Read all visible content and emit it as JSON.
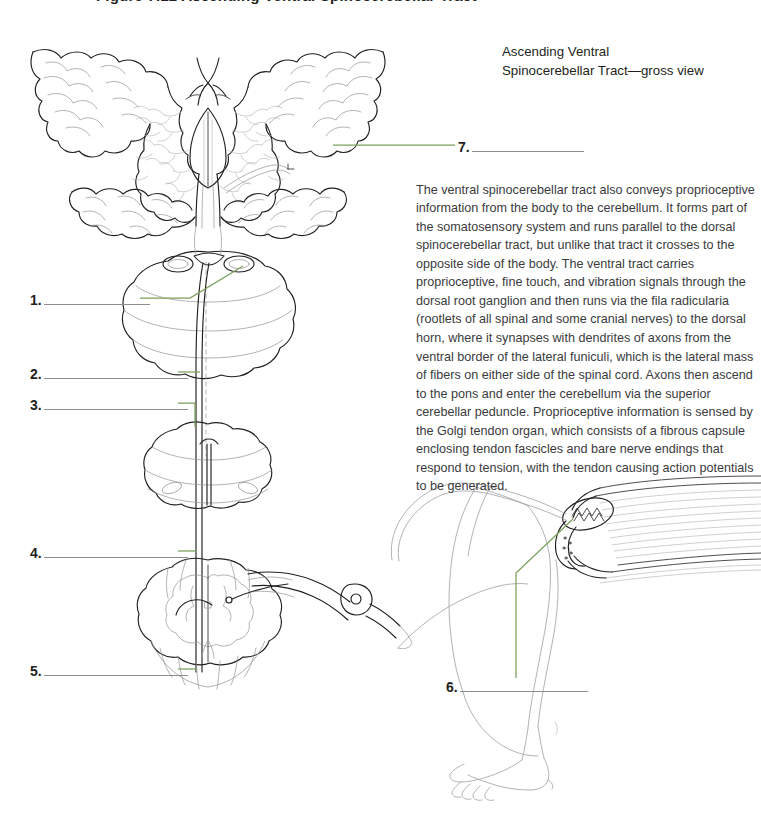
{
  "page": {
    "background": "#ffffff",
    "width": 761,
    "height": 814
  },
  "colors": {
    "ink": "#231f20",
    "body_text": "#3b3b3d",
    "leader_green": "#7ba05b",
    "blank_rule": "#8d8d90",
    "art_stroke_dark": "#231f20",
    "art_stroke_light": "#9a9a9e"
  },
  "cutoff_heading": {
    "text": "Figure 7.12 Ascending Ventral Spinocerebellar Tract"
  },
  "heading": {
    "line1": "Ascending Ventral",
    "line2": "Spinocerebellar Tract—gross view"
  },
  "body": {
    "paragraph": "The ventral spinocerebellar tract also conveys proprioceptive information from the body to the cerebellum. It forms part of the somatosensory system and runs parallel to the dorsal spinocerebellar tract, but unlike that tract it crosses to the opposite side of the body. The ventral tract carries proprioceptive, fine touch, and vibration signals through the dorsal root ganglion and then runs via the fila radicularia (rootlets of all spinal and some cranial nerves) to the dorsal horn, where it synapses with dendrites of axons from the ventral border of the lateral funiculi, which is the lateral mass of fibers on either side of the spinal cord. Axons then ascend to the pons and enter the cerebellum via the superior cerebellar peduncle. Proprioceptive information is sensed by the Golgi tendon organ, which consists of a fibrous capsule enclosing tendon fascicles and bare nerve endings that respond to tension, with the tendon causing action potentials to be generated."
  },
  "blanks": [
    {
      "id": 1,
      "number": "1.",
      "answer": "",
      "x": 30,
      "y": 291,
      "rule_width": 106,
      "side": "left"
    },
    {
      "id": 2,
      "number": "2.",
      "answer": "",
      "x": 30,
      "y": 365,
      "rule_width": 144,
      "side": "left"
    },
    {
      "id": 3,
      "number": "3.",
      "answer": "",
      "x": 30,
      "y": 396,
      "rule_width": 144,
      "side": "left"
    },
    {
      "id": 4,
      "number": "4.",
      "answer": "",
      "x": 30,
      "y": 544,
      "rule_width": 144,
      "side": "left"
    },
    {
      "id": 5,
      "number": "5.",
      "answer": "",
      "x": 30,
      "y": 662,
      "rule_width": 144,
      "side": "left"
    },
    {
      "id": 6,
      "number": "6.",
      "answer": "",
      "x": 446,
      "y": 678,
      "rule_width": 128,
      "side": "right"
    },
    {
      "id": 7,
      "number": "7.",
      "answer": "",
      "x": 458,
      "y": 138,
      "rule_width": 112,
      "side": "right"
    }
  ],
  "artwork": {
    "caption": "line-art illustration of the ascending ventral spinocerebellar tract",
    "parts": [
      {
        "name": "cerebellum-cross-section",
        "label_target": 7
      },
      {
        "name": "medulla-cross-section",
        "label_target": 1
      },
      {
        "name": "medulla-lower-region",
        "label_target": 2
      },
      {
        "name": "tract-fiber-upper",
        "label_target": 3
      },
      {
        "name": "spinal-cord-thoracic-section",
        "label_target": 4
      },
      {
        "name": "spinal-cord-lumbar-section",
        "label_target": 5
      },
      {
        "name": "golgi-tendon-organ",
        "label_target": 6
      },
      {
        "name": "leg-and-muscle",
        "label_target": null
      },
      {
        "name": "dorsal-root-ganglion",
        "label_target": null
      }
    ]
  }
}
